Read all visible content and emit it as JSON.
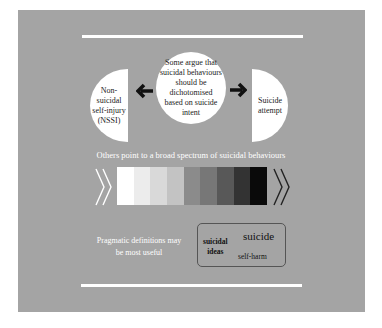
{
  "diagram": {
    "colors": {
      "panel_background": "#a4a4a4",
      "rule": "#ffffff",
      "shape_fill": "#ffffff",
      "arrow": "#111111",
      "box_border": "#555555"
    },
    "center_circle": {
      "text": "Some argue that\nsuicidal behaviours\nshould be\ndichotomised\nbased on suicide\nintent"
    },
    "left_half_circle": {
      "text": "Non-\nsuicidal\nself-injury\n(NSSI)"
    },
    "right_half_circle": {
      "text": "Suicide\nattempt"
    },
    "arrows": {
      "left": "arrow-left-icon",
      "right": "arrow-right-icon"
    },
    "spectrum": {
      "label": "Others point to a broad spectrum of suicidal behaviours",
      "blocks": [
        "#ffffff",
        "#ececec",
        "#d9d9d9",
        "#c3c3c3",
        "#8b8b8b",
        "#777777",
        "#585858",
        "#333333",
        "#0a0a0a"
      ],
      "left_chevron_color": "#ffffff",
      "right_chevron_color": "#222222"
    },
    "pragmatic": {
      "text": "Pragmatic definitions may\nbe most useful"
    },
    "definition_box": {
      "suicidal_ideas": "suicidal\nideas",
      "suicide": "suicide",
      "self_harm": "self-harm"
    }
  }
}
